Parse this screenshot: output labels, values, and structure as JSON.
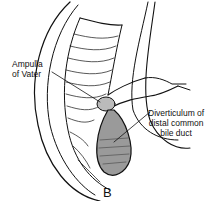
{
  "figure": {
    "panel_label": "B",
    "labels": {
      "ampulla": [
        "Ampulla",
        "of Vater"
      ],
      "diverticulum": [
        "Diverticulum of",
        "distal common",
        "bile duct"
      ]
    },
    "colors": {
      "ink": "#111111",
      "background": "#ffffff"
    }
  }
}
